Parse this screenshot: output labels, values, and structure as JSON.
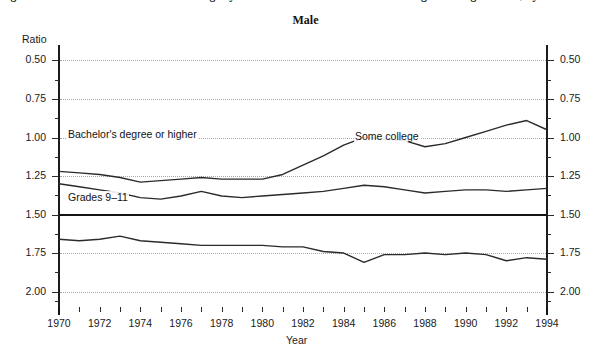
{
  "clipped_heading": "Figure 2.—Ratio of median annual earnings by educational attainment to those of high school graduates, by sex: 1970–1994",
  "chart_title": "Male",
  "axes": {
    "y_axis_name": "Ratio",
    "x_axis_name": "Year",
    "y_labels_left": [
      "2.00",
      "1.75",
      "1.50",
      "1.25",
      "1.00",
      "0.75",
      "0.50"
    ],
    "y_labels_right": [
      "2.00",
      "1.75",
      "1.50",
      "1.25",
      "1.00",
      "0.75",
      "0.50"
    ],
    "x_labels": [
      "1970",
      "1972",
      "1974",
      "1976",
      "1978",
      "1980",
      "1982",
      "1984",
      "1986",
      "1988",
      "1990",
      "1992",
      "1994"
    ]
  },
  "annotations": {
    "bachelors": "Bachelor's degree or higher",
    "some_college": "Some college",
    "grades": "Grades 9–11"
  },
  "colors": {
    "line": "#2b2b2b",
    "axis": "#1c1c1c",
    "grid": "#a9a9a9",
    "baseline": "#141414"
  },
  "chart_data": {
    "type": "line",
    "title": "Male",
    "subtitle": "",
    "xlabel": "Year",
    "ylabel": "Ratio",
    "xlim": [
      1970,
      1994
    ],
    "ylim": [
      0.4,
      2.1
    ],
    "yticks": [
      0.5,
      0.75,
      1.0,
      1.25,
      1.5,
      1.75,
      2.0
    ],
    "grid": true,
    "grid_style": "dotted-horizontal",
    "reference_line": 1.0,
    "legend": "inline-annotations",
    "x": [
      1970,
      1971,
      1972,
      1973,
      1974,
      1975,
      1976,
      1977,
      1978,
      1979,
      1980,
      1981,
      1982,
      1983,
      1984,
      1985,
      1986,
      1987,
      1988,
      1989,
      1990,
      1991,
      1992,
      1993,
      1994
    ],
    "series": [
      {
        "name": "Bachelor's degree or higher",
        "values": [
          1.28,
          1.27,
          1.26,
          1.24,
          1.21,
          1.22,
          1.23,
          1.24,
          1.23,
          1.23,
          1.23,
          1.26,
          1.32,
          1.38,
          1.45,
          1.5,
          1.49,
          1.48,
          1.44,
          1.46,
          1.5,
          1.54,
          1.58,
          1.61,
          1.55
        ]
      },
      {
        "name": "Some college",
        "values": [
          1.2,
          1.18,
          1.16,
          1.14,
          1.11,
          1.1,
          1.12,
          1.15,
          1.12,
          1.11,
          1.12,
          1.13,
          1.14,
          1.15,
          1.17,
          1.19,
          1.18,
          1.16,
          1.14,
          1.15,
          1.16,
          1.16,
          1.15,
          1.16,
          1.17
        ]
      },
      {
        "name": "Grades 9–11",
        "values": [
          0.84,
          0.83,
          0.84,
          0.86,
          0.83,
          0.82,
          0.81,
          0.8,
          0.8,
          0.8,
          0.8,
          0.79,
          0.79,
          0.76,
          0.75,
          0.69,
          0.74,
          0.74,
          0.75,
          0.74,
          0.75,
          0.74,
          0.7,
          0.72,
          0.71
        ]
      }
    ]
  }
}
